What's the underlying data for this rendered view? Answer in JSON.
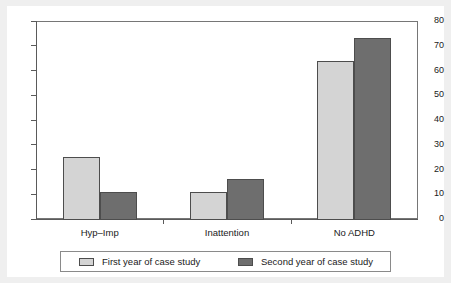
{
  "chart_data": {
    "type": "bar",
    "title": "",
    "subtitle": "",
    "xlabel": "",
    "ylabel": "",
    "categories": [
      "Hyp–Imp",
      "Inattention",
      "No ADHD"
    ],
    "series": [
      {
        "name": "First year of case study",
        "color": "#d4d4d4",
        "values": [
          25,
          11,
          64
        ]
      },
      {
        "name": "Second year of case study",
        "color": "#6e6e6e",
        "values": [
          11,
          16,
          73
        ]
      }
    ],
    "ylim": [
      0,
      80
    ],
    "ytick_labels": [
      "0",
      "10",
      "20",
      "30",
      "40",
      "50",
      "60",
      "70",
      "80"
    ],
    "ytick_values": [
      0,
      10,
      20,
      30,
      40,
      50,
      60,
      70,
      80
    ],
    "grid": false,
    "legend_position": "below",
    "legend_entries": [
      "First year of case study",
      "Second year of case study"
    ],
    "annotations": []
  },
  "colors": {
    "series_light": "#d4d4d4",
    "series_dark": "#6e6e6e",
    "bar_outline": "#4d4d4d",
    "axis": "#5a5a5a",
    "frame": "#767676",
    "panel_background": "#ffffff",
    "page_background": "#efefef",
    "text": "#1a1a1a"
  }
}
